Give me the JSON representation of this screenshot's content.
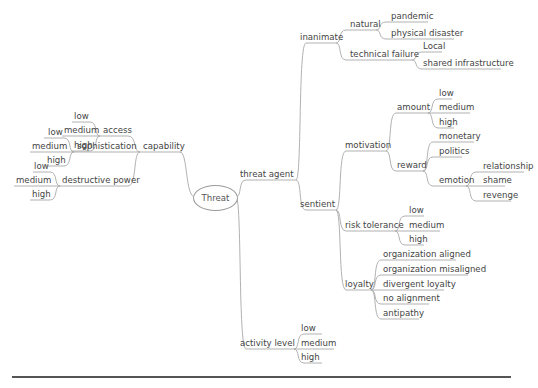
{
  "diagram": {
    "type": "mind-map",
    "root": "Threat",
    "colors": {
      "line": "#a8a8a8",
      "text": "#444444",
      "divider": "#555555"
    },
    "left": {
      "capability": {
        "label": "capability",
        "children": {
          "access": {
            "label": "access",
            "levels": [
              "low",
              "medium",
              "high"
            ]
          },
          "sophistication": {
            "label": "sophistication",
            "levels": [
              "low",
              "medium",
              "high"
            ]
          },
          "destructive_power": {
            "label": "destructive power",
            "levels": [
              "low",
              "medium",
              "high"
            ]
          }
        }
      }
    },
    "right": {
      "threat_agent": {
        "label": "threat agent",
        "inanimate": {
          "label": "inanimate",
          "natural": {
            "label": "natural",
            "items": [
              "pandemic",
              "physical disaster"
            ]
          },
          "technical_failure": {
            "label": "technical failure",
            "items": [
              "Local",
              "shared infrastructure"
            ]
          }
        },
        "sentient": {
          "label": "sentient",
          "motivation": {
            "label": "motivation",
            "amount": {
              "label": "amount",
              "levels": [
                "low",
                "medium",
                "high"
              ]
            },
            "reward": {
              "label": "reward",
              "items": [
                "monetary",
                "politics"
              ],
              "emotion": {
                "label": "emotion",
                "items": [
                  "relationship",
                  "shame",
                  "revenge"
                ]
              }
            }
          },
          "risk_tolerance": {
            "label": "risk tolerance",
            "levels": [
              "low",
              "medium",
              "high"
            ]
          },
          "loyalty": {
            "label": "loyalty",
            "items": [
              "organization aligned",
              "organization misaligned",
              "divergent loyalty",
              "no alignment",
              "antipathy"
            ]
          }
        }
      },
      "activity_level": {
        "label": "activity level",
        "levels": [
          "low",
          "medium",
          "high"
        ]
      }
    }
  }
}
